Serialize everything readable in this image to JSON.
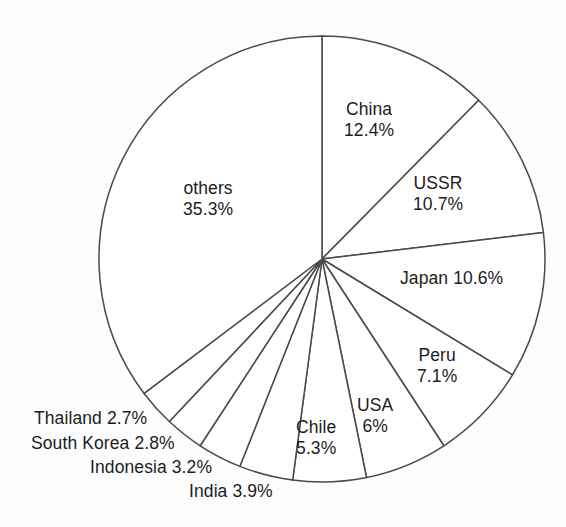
{
  "chart_data": {
    "type": "pie",
    "title": "",
    "subtitle": "",
    "xlabel": "",
    "ylabel": "",
    "legend_position": "none",
    "grid": false,
    "units": "%",
    "start_angle_deg": 0,
    "direction": "clockwise",
    "categories": [
      "China",
      "USSR",
      "Japan",
      "Peru",
      "USA",
      "Chile",
      "India",
      "Indonesia",
      "South Korea",
      "Thailand",
      "others"
    ],
    "values": [
      12.4,
      10.7,
      10.6,
      7.1,
      6.0,
      5.3,
      3.9,
      3.2,
      2.8,
      2.7,
      35.3
    ],
    "slices": [
      {
        "name": "China",
        "value": 12.4,
        "value_text": "12.4%",
        "label_mode": "stacked",
        "label_placement": "inside",
        "label_align": "center-align",
        "left": 344,
        "top": 99
      },
      {
        "name": "USSR",
        "value": 10.7,
        "value_text": "10.7%",
        "label_mode": "stacked",
        "label_placement": "inside",
        "label_align": "center-align",
        "left": 413,
        "top": 173
      },
      {
        "name": "Japan",
        "value": 10.6,
        "value_text": "10.6%",
        "label_mode": "inline",
        "label_placement": "inside",
        "label_align": "left-align",
        "left": 400,
        "top": 268
      },
      {
        "name": "Peru",
        "value": 7.1,
        "value_text": "7.1%",
        "label_mode": "stacked",
        "label_placement": "inside",
        "label_align": "center-align",
        "left": 417,
        "top": 345
      },
      {
        "name": "USA",
        "value": 6.0,
        "value_text": "6%",
        "label_mode": "stacked",
        "label_placement": "inside",
        "label_align": "center-align",
        "left": 357,
        "top": 395
      },
      {
        "name": "Chile",
        "value": 5.3,
        "value_text": "5.3%",
        "label_mode": "stacked",
        "label_placement": "inside",
        "label_align": "center-align",
        "left": 296,
        "top": 417
      },
      {
        "name": "India",
        "value": 3.9,
        "value_text": "3.9%",
        "label_mode": "inline",
        "label_placement": "outside",
        "label_align": "right-align",
        "left": 189,
        "top": 481
      },
      {
        "name": "Indonesia",
        "value": 3.2,
        "value_text": "3.2%",
        "label_mode": "inline",
        "label_placement": "outside",
        "label_align": "right-align",
        "left": 90,
        "top": 457
      },
      {
        "name": "South Korea",
        "value": 2.8,
        "value_text": "2.8%",
        "label_mode": "inline",
        "label_placement": "outside",
        "label_align": "right-align",
        "left": 31,
        "top": 433
      },
      {
        "name": "Thailand",
        "value": 2.7,
        "value_text": "2.7%",
        "label_mode": "inline",
        "label_placement": "outside",
        "label_align": "right-align",
        "left": 34,
        "top": 408
      },
      {
        "name": "others",
        "value": 35.3,
        "value_text": "35.3%",
        "label_mode": "stacked",
        "label_placement": "inside",
        "label_align": "center-align",
        "left": 183,
        "top": 178
      }
    ],
    "geometry": {
      "center_x": 322,
      "center_y": 259,
      "radius": 223
    },
    "style": {
      "slice_fill": "#ffffff",
      "slice_stroke": "#4a4a4a",
      "text_color": "#1c1c1c",
      "background": "#fdfdfd"
    }
  }
}
